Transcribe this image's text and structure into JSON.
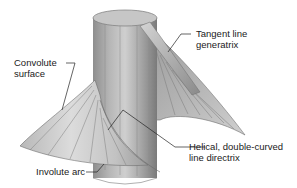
{
  "figure": {
    "colors": {
      "cylinder_light": "#c9c9c9",
      "cylinder_dark": "#7d7d7d",
      "surface_light": "#d6d6d6",
      "surface_dark": "#8a8a8a",
      "leader": "#222222",
      "text": "#1a1a1a"
    }
  },
  "labels": {
    "convolute_surface": {
      "line1": "Convolute",
      "line2": "surface"
    },
    "tangent_line": {
      "line1": "Tangent line",
      "line2": "generatrix"
    },
    "helical": {
      "line1": "Helical, double-curved",
      "line2": "line directrix"
    },
    "involute_arc": {
      "line1": "Involute arc"
    }
  }
}
